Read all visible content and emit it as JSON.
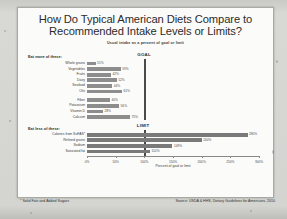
{
  "document": {
    "title_line1": "How Do Typical American Diets Compare to",
    "title_line2": "Recommended Intake Levels or Limits?",
    "subtitle": "Usual intake as a percent of goal or limit",
    "footnote_left": "* Solid Fats and Added Sugars",
    "footnote_right": "Source: USDA & HHS, Dietary Guidelines for Americans, 2010"
  },
  "chart_data": {
    "type": "bar",
    "orientation": "horizontal",
    "title": "How Do Typical American Diets Compare to Recommended Intake Levels or Limits?",
    "subtitle": "Usual intake as a percent of goal or limit",
    "xlabel": "Percent of goal or limit",
    "ylabel": "",
    "xlim": [
      0,
      300
    ],
    "grid": false,
    "tick_labels": [
      "0%",
      "50%",
      "100%",
      "150%",
      "200%",
      "250%",
      "300%"
    ],
    "tick_values": [
      0,
      50,
      100,
      150,
      200,
      250,
      300
    ],
    "reference_lines": [
      {
        "label": "GOAL",
        "value": 100,
        "section": "eat-more"
      },
      {
        "label": "LIMIT",
        "value": 100,
        "section": "eat-less"
      }
    ],
    "groups": [
      {
        "heading": "Eat more of these:",
        "categories": [
          "Whole grains",
          "Vegetables",
          "Fruits",
          "Dairy",
          "Seafood",
          "Oils",
          "Fiber",
          "Potassium",
          "Vitamin D",
          "Calcium"
        ],
        "values": [
          15,
          59,
          42,
          52,
          44,
          61,
          40,
          56,
          28,
          75
        ],
        "value_labels": [
          "15%",
          "59%",
          "42%",
          "52%",
          "44%",
          "61%",
          "40%",
          "56%",
          "28%",
          "75%"
        ]
      },
      {
        "heading": "Eat less of these:",
        "categories": [
          "Calories from SoFAS*",
          "Refined grains",
          "Sodium",
          "Saturated fat"
        ],
        "values": [
          280,
          200,
          149,
          110
        ],
        "value_labels": [
          "280%",
          "200%",
          "149%",
          "110%"
        ]
      }
    ]
  }
}
